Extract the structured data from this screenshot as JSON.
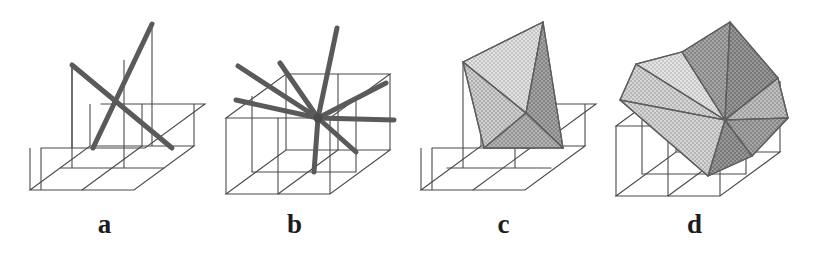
{
  "figure": {
    "width": 836,
    "height": 256,
    "background_color": "#ffffff"
  },
  "style": {
    "grid_line_color": "#4a4a4a",
    "grid_line_width": 1.1,
    "thick_line_color": "#5a5a5a",
    "thick_line_width": 5,
    "facet_edge_color": "#5e5e5e",
    "facet_edge_width": 1.2,
    "shade_light": "#d8d8d8",
    "shade_mid": "#bcbcbc",
    "shade_dark": "#9a9a9a",
    "shade_darkest": "#888888",
    "label_color": "#1c1c1c"
  },
  "panels": [
    {
      "id": "a",
      "label": "a",
      "x": 0,
      "caption_x": 125,
      "caption_y": 228,
      "content": "two thick crossing segments above a 2x2 grid cell base",
      "spoke_count": 2,
      "shaded": false,
      "base_grid": {
        "rows": 2,
        "cols": 2,
        "origin": [
          30,
          190
        ],
        "u": [
          52,
          0
        ],
        "v": [
          30,
          -22
        ]
      },
      "center_3d": [
        120,
        113
      ],
      "verticals": [
        {
          "from": [
            72,
            148
          ],
          "to": [
            72,
            65
          ]
        },
        {
          "from": [
            124,
            148
          ],
          "to": [
            124,
            60
          ]
        },
        {
          "from": [
            152,
            126
          ],
          "to": [
            152,
            24
          ]
        }
      ],
      "thick_segments": [
        {
          "from": [
            72,
            65
          ],
          "to": [
            172,
            148
          ],
          "name": "ridge-northwest-to-southeast"
        },
        {
          "from": [
            93,
            148
          ],
          "to": [
            152,
            24
          ],
          "name": "ridge-southwest-to-northeast"
        }
      ]
    },
    {
      "id": "b",
      "label": "b",
      "x": 190,
      "caption_x": 313,
      "caption_y": 228,
      "content": "eight thick spokes radiating from one interior vertex over 2x2 grid base",
      "spoke_count": 8,
      "shaded": false,
      "center_3d": [
        128,
        118
      ],
      "spoke_endpoints": [
        [
          46,
          100
        ],
        [
          48,
          66
        ],
        [
          90,
          63
        ],
        [
          147,
          28
        ],
        [
          196,
          83
        ],
        [
          204,
          120
        ],
        [
          166,
          152
        ],
        [
          124,
          172
        ]
      ]
    },
    {
      "id": "c",
      "label": "c",
      "x": 399,
      "caption_x": 516,
      "caption_y": 228,
      "content": "four shaded triangular facets spanning the two ridge segments",
      "spoke_count": 4,
      "shaded": true,
      "facet_count": 4,
      "center_3d": [
        127,
        113
      ]
    },
    {
      "id": "d",
      "label": "d",
      "x": 590,
      "caption_x": 700,
      "caption_y": 228,
      "content": "eight shaded triangular facets forming closed pinwheel surface",
      "spoke_count": 8,
      "shaded": true,
      "facet_count": 8,
      "center_3d": [
        135,
        120
      ]
    }
  ]
}
